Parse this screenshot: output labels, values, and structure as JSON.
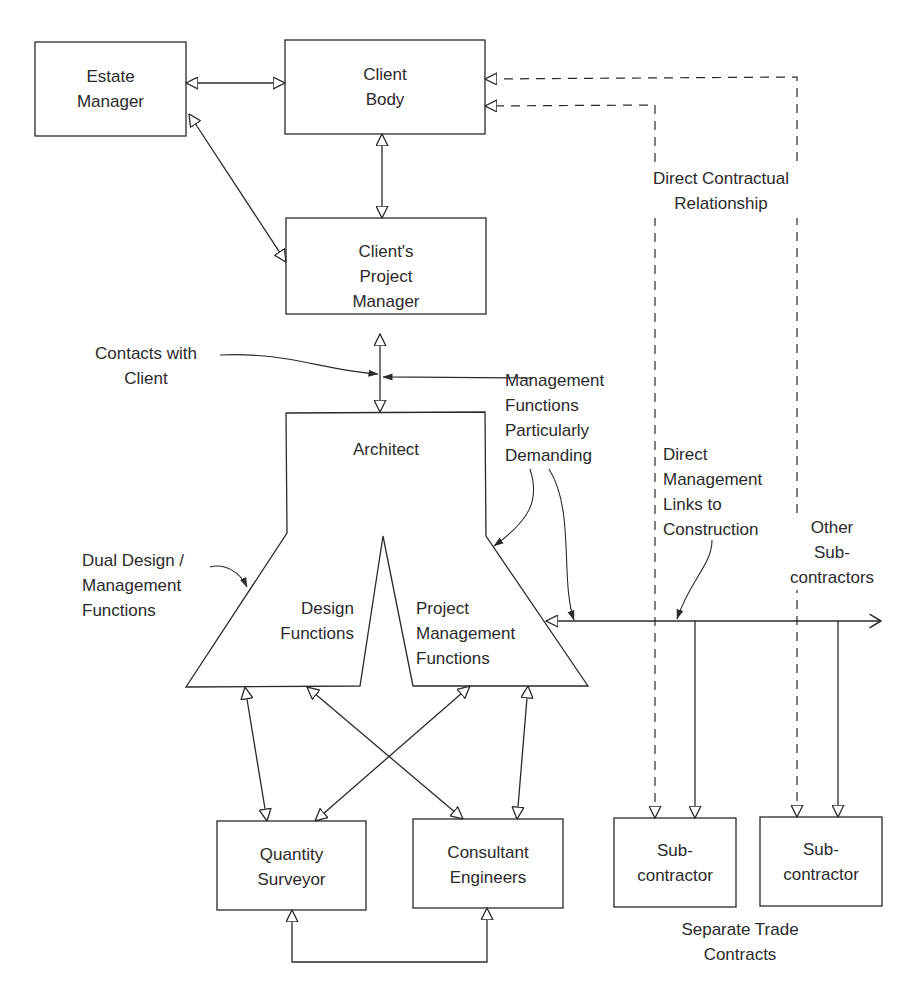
{
  "diagram": {
    "type": "organizational-relationship-diagram",
    "nodes": {
      "estate_manager": [
        "Estate",
        "Manager"
      ],
      "client_body": [
        "Client",
        "Body"
      ],
      "clients_project_manager": [
        "Client's",
        "Project",
        "Manager"
      ],
      "architect": [
        "Architect"
      ],
      "design_functions": [
        "Design",
        "Functions"
      ],
      "project_management_functions": [
        "Project",
        "Management",
        "Functions"
      ],
      "quantity_surveyor": [
        "Quantity",
        "Surveyor"
      ],
      "consultant_engineers": [
        "Consultant",
        "Engineers"
      ],
      "subcontractor_1": [
        "Sub-",
        "contractor"
      ],
      "subcontractor_2": [
        "Sub-",
        "contractor"
      ]
    },
    "annotations": {
      "direct_contractual": [
        "Direct Contractual",
        "Relationship"
      ],
      "contacts_with_client": [
        "Contacts with",
        "Client"
      ],
      "management_demanding": [
        "Management",
        "Functions",
        "Particularly",
        "Demanding"
      ],
      "direct_management_links": [
        "Direct",
        "Management",
        "Links to",
        "Construction"
      ],
      "other_subcontractors": [
        "Other",
        "Sub-",
        "contractors"
      ],
      "dual_design": [
        "Dual Design /",
        "Management",
        "Functions"
      ],
      "separate_trade": [
        "Separate Trade",
        "Contracts"
      ]
    },
    "edges": [
      {
        "from": "Estate Manager",
        "to": "Client Body",
        "style": "solid",
        "arrows": "both"
      },
      {
        "from": "Estate Manager",
        "to": "Client's Project Manager",
        "style": "solid",
        "arrows": "both"
      },
      {
        "from": "Client Body",
        "to": "Client's Project Manager",
        "style": "solid",
        "arrows": "both"
      },
      {
        "from": "Client's Project Manager",
        "to": "Architect",
        "style": "solid",
        "arrows": "both"
      },
      {
        "from": "Sub-contractor 1",
        "to": "Client Body",
        "style": "dashed",
        "arrows": "both"
      },
      {
        "from": "Sub-contractor 2",
        "to": "Client Body",
        "style": "dashed",
        "arrows": "both"
      },
      {
        "from": "Project Management Functions",
        "to": "Sub-contractors",
        "style": "solid",
        "arrows": "both"
      },
      {
        "from": "Design Functions",
        "to": "Quantity Surveyor",
        "style": "solid",
        "arrows": "both"
      },
      {
        "from": "Design Functions",
        "to": "Consultant Engineers",
        "style": "solid",
        "arrows": "both"
      },
      {
        "from": "Project Management Functions",
        "to": "Quantity Surveyor",
        "style": "solid",
        "arrows": "both"
      },
      {
        "from": "Project Management Functions",
        "to": "Consultant Engineers",
        "style": "solid",
        "arrows": "both"
      },
      {
        "from": "Quantity Surveyor",
        "to": "Consultant Engineers",
        "style": "solid",
        "arrows": "both"
      }
    ],
    "colors": {
      "stroke": "#2a2a2a",
      "background": "#ffffff"
    }
  }
}
